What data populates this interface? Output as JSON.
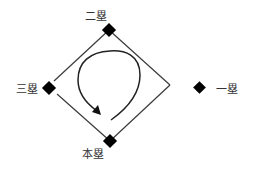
{
  "diagram": {
    "title": "",
    "colors": {
      "line": "#3a3a3a",
      "base_marker": "#000000",
      "text": "#333333",
      "background": "#ffffff"
    },
    "bases": {
      "second": {
        "label": "二塁",
        "marker_x": 109,
        "marker_y": 30
      },
      "third": {
        "label": "三塁",
        "marker_x": 49,
        "marker_y": 88
      },
      "home": {
        "label": "本塁",
        "marker_x": 110,
        "marker_y": 141
      },
      "first": {
        "label": "一塁",
        "marker_x": 200,
        "marker_y": 88
      }
    },
    "field_outline": {
      "top": [
        109,
        30
      ],
      "right": [
        170,
        85
      ],
      "bottom": [
        110,
        141
      ],
      "left": [
        52,
        88
      ]
    },
    "running_path": {
      "direction": "counterclockwise",
      "arrow_icon": "arrowhead"
    }
  }
}
